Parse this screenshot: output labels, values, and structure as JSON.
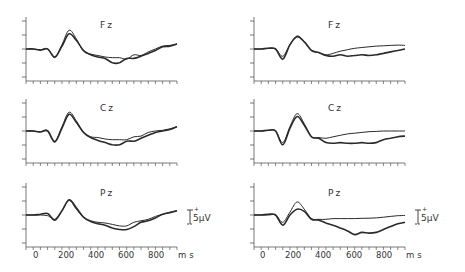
{
  "chart_data": [
    {
      "type": "line",
      "panel": "left-top",
      "title": "Fz",
      "xlabel": "ms",
      "xlim": [
        -100,
        950
      ],
      "ylabel": "µV",
      "x": [
        -100,
        -50,
        0,
        50,
        100,
        150,
        200,
        250,
        300,
        350,
        400,
        450,
        500,
        550,
        600,
        650,
        700,
        750,
        800,
        850,
        900,
        950
      ],
      "series": [
        {
          "name": "condition A (thin)",
          "values": [
            0,
            0,
            -0.5,
            0.2,
            -6,
            3,
            13,
            7,
            -1.5,
            -3.5,
            -4.5,
            -5.5,
            -6,
            -6,
            -7,
            -4,
            -4.5,
            -2,
            0,
            2,
            2.5,
            3.5
          ]
        },
        {
          "name": "condition B (thick)",
          "values": [
            0,
            0,
            -0.8,
            0,
            -5.5,
            2,
            10.5,
            6,
            -1,
            -4,
            -5.5,
            -6.5,
            -9.5,
            -9.5,
            -6.5,
            -6.5,
            -5,
            -3,
            -1,
            1.5,
            2,
            3.5
          ]
        }
      ]
    },
    {
      "type": "line",
      "panel": "right-top",
      "title": "Fz",
      "xlabel": "ms",
      "xlim": [
        -100,
        950
      ],
      "ylabel": "µV",
      "x": [
        -100,
        -50,
        0,
        50,
        100,
        150,
        200,
        250,
        300,
        350,
        400,
        450,
        500,
        550,
        600,
        650,
        700,
        750,
        800,
        850,
        900,
        950
      ],
      "series": [
        {
          "name": "condition A (thin)",
          "values": [
            0,
            0,
            0.5,
            0,
            -5,
            3,
            9,
            5,
            -1,
            -2.5,
            -4,
            -3,
            -1.5,
            -0.5,
            0.5,
            1,
            1.5,
            2,
            2.2,
            2.5,
            2.7,
            2.5
          ]
        },
        {
          "name": "condition B (thick)",
          "values": [
            0,
            0,
            0.5,
            0,
            -7,
            3,
            8.5,
            5,
            -1,
            -2.5,
            -4.5,
            -5,
            -4,
            -5,
            -4.5,
            -4,
            -4.5,
            -4,
            -3,
            -2,
            -1,
            0
          ]
        }
      ]
    },
    {
      "type": "line",
      "panel": "left-middle",
      "title": "Cz",
      "xlabel": "ms",
      "xlim": [
        -100,
        950
      ],
      "ylabel": "µV",
      "x": [
        -100,
        -50,
        0,
        50,
        100,
        150,
        200,
        250,
        300,
        350,
        400,
        450,
        500,
        550,
        600,
        650,
        700,
        750,
        800,
        850,
        900,
        950
      ],
      "series": [
        {
          "name": "condition A (thin)",
          "values": [
            0,
            0,
            -0.5,
            0.5,
            -7,
            3,
            13,
            7,
            -1,
            -4,
            -4.5,
            -5.5,
            -6,
            -6,
            -6,
            -4,
            -3.5,
            -1,
            0,
            0.5,
            1.5,
            3
          ]
        },
        {
          "name": "condition B (thick)",
          "values": [
            0,
            0,
            -0.7,
            0,
            -7.5,
            2,
            11.5,
            6,
            -1,
            -4.5,
            -6.5,
            -8,
            -9.5,
            -9.5,
            -7,
            -7,
            -5,
            -3,
            -1,
            0,
            1,
            3
          ]
        }
      ]
    },
    {
      "type": "line",
      "panel": "right-middle",
      "title": "Cz",
      "xlabel": "ms",
      "xlim": [
        -100,
        950
      ],
      "ylabel": "µV",
      "x": [
        -100,
        -50,
        0,
        50,
        100,
        150,
        200,
        250,
        300,
        350,
        400,
        450,
        500,
        550,
        600,
        650,
        700,
        750,
        800,
        850,
        900,
        950
      ],
      "series": [
        {
          "name": "condition A (thin)",
          "values": [
            0,
            0,
            0.5,
            0,
            -8,
            3,
            12,
            5,
            -4,
            -4.5,
            -5,
            -4,
            -3,
            -2,
            -1.5,
            -1,
            -0.5,
            -0.3,
            0,
            0,
            0,
            0
          ]
        },
        {
          "name": "condition B (thick)",
          "values": [
            0,
            0,
            0.5,
            0,
            -9.5,
            2,
            10,
            4,
            -4,
            -5,
            -8,
            -8.5,
            -8,
            -8.5,
            -8.5,
            -8,
            -8.5,
            -8,
            -6,
            -5,
            -4,
            -3.5
          ]
        }
      ]
    },
    {
      "type": "line",
      "panel": "left-bottom",
      "title": "Pz",
      "xlabel": "ms",
      "xlim": [
        -100,
        950
      ],
      "ylabel": "µV",
      "x": [
        -100,
        -50,
        0,
        50,
        100,
        150,
        200,
        250,
        300,
        350,
        400,
        450,
        500,
        550,
        600,
        650,
        700,
        750,
        800,
        850,
        900,
        950
      ],
      "series": [
        {
          "name": "condition A (thin)",
          "values": [
            0,
            0,
            0,
            -0.5,
            -3,
            3,
            10,
            4,
            -1.5,
            -4,
            -5,
            -5.5,
            -6.5,
            -7.5,
            -7.5,
            -5,
            -4,
            -3,
            -1,
            0.5,
            2,
            3
          ]
        },
        {
          "name": "condition B (thick)",
          "values": [
            0,
            0,
            0.5,
            1,
            -3.5,
            3,
            10.5,
            5,
            -1.5,
            -4.5,
            -6,
            -7,
            -9,
            -10,
            -10,
            -8,
            -5,
            -4,
            -2,
            0.5,
            1.5,
            3
          ]
        }
      ]
    },
    {
      "type": "line",
      "panel": "right-bottom",
      "title": "Pz",
      "xlabel": "ms",
      "xlim": [
        -100,
        950
      ],
      "ylabel": "µV",
      "x": [
        -100,
        -50,
        0,
        50,
        100,
        150,
        200,
        250,
        300,
        350,
        400,
        450,
        500,
        550,
        600,
        650,
        700,
        750,
        800,
        850,
        900,
        950
      ],
      "series": [
        {
          "name": "condition A (thin)",
          "values": [
            0,
            0,
            0,
            0,
            -5,
            2,
            9,
            4,
            -2.5,
            -3,
            -3,
            -2.5,
            -2.5,
            -2.5,
            -2.5,
            -2.3,
            -2.2,
            -2,
            -1.5,
            -1,
            -0.5,
            -0.3
          ]
        },
        {
          "name": "condition B (thick)",
          "values": [
            0,
            0,
            0.5,
            0,
            -7,
            0,
            4,
            2.5,
            -3,
            -3.5,
            -5.5,
            -7,
            -9,
            -11,
            -13.5,
            -12,
            -12.5,
            -12,
            -10,
            -8,
            -6,
            -5
          ]
        }
      ]
    }
  ],
  "figure": {
    "left_column": {
      "panels": [
        {
          "label": "Fz"
        },
        {
          "label": "Cz"
        },
        {
          "label": "Pz"
        }
      ],
      "x_ticks": [
        "0",
        "200",
        "400",
        "600",
        "800"
      ],
      "x_unit": "ms",
      "scale_bar": {
        "plus": "+",
        "label": "5µV"
      }
    },
    "right_column": {
      "panels": [
        {
          "label": "Fz"
        },
        {
          "label": "Cz"
        },
        {
          "label": "Pz"
        }
      ],
      "x_ticks": [
        "0",
        "200",
        "400",
        "600",
        "800"
      ],
      "x_unit": "ms",
      "scale_bar": {
        "plus": "+",
        "label": "5µV"
      }
    }
  },
  "colors": {
    "trace": "#2a2a2a",
    "axis": "#555555",
    "background": "#ffffff"
  }
}
